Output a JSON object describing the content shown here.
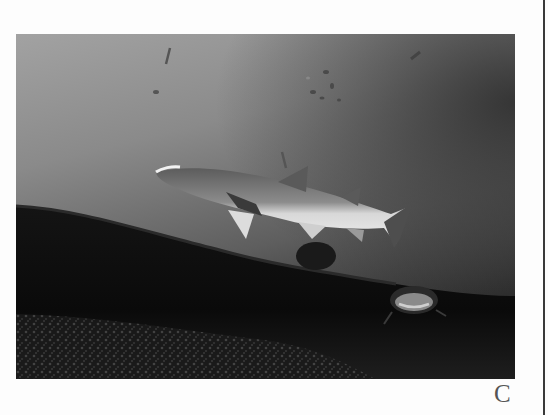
{
  "figure": {
    "label": "C",
    "photo": {
      "subject": "underwater-shark-photograph",
      "tone": "grayscale",
      "colors": {
        "water_top": "#9c9c9c",
        "water_mid": "#6a6a6a",
        "water_deep": "#3a3a3a",
        "reef": "#0c0c0c",
        "shark_belly": "#e6e6e6",
        "shark_back": "#5a5a5a"
      }
    }
  }
}
